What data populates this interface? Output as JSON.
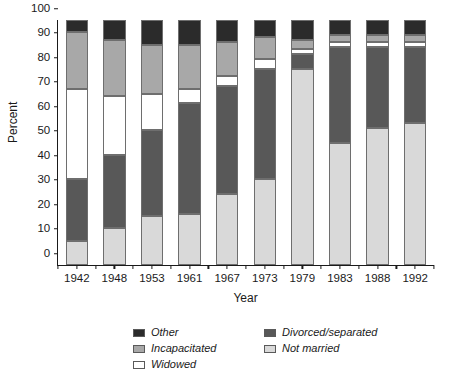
{
  "chart_data": {
    "type": "bar",
    "title": "",
    "subtitle": "",
    "xlabel": "Year",
    "ylabel": "Percent",
    "ylim": [
      0,
      100
    ],
    "yticks": [
      0,
      10,
      20,
      30,
      40,
      50,
      60,
      70,
      80,
      90,
      100
    ],
    "grid": false,
    "stacked": true,
    "stack_total": 100,
    "legend_position": "below-center",
    "categories": [
      "1942",
      "1948",
      "1953",
      "1961",
      "1967",
      "1973",
      "1979",
      "1983",
      "1988",
      "1992"
    ],
    "series": [
      {
        "name": "Not married",
        "color": "#d9d9d9",
        "values": [
          10,
          15,
          20,
          21,
          29,
          35,
          80,
          50,
          56,
          58
        ]
      },
      {
        "name": "Divorced/separated",
        "color": "#585858",
        "values": [
          25,
          30,
          35,
          45,
          44,
          45,
          6,
          39,
          33,
          31
        ]
      },
      {
        "name": "Widowed",
        "color": "#ffffff",
        "values": [
          37,
          24,
          15,
          6,
          4,
          4,
          2,
          2,
          2,
          2
        ]
      },
      {
        "name": "Incapacitated",
        "color": "#a8a8a8",
        "values": [
          23,
          23,
          20,
          18,
          14,
          9,
          4,
          3,
          3,
          3
        ]
      },
      {
        "name": "Other",
        "color": "#2b2b2b",
        "values": [
          5,
          8,
          10,
          10,
          9,
          7,
          8,
          6,
          6,
          6
        ]
      }
    ],
    "stack_boundaries": {
      "1942": [
        0,
        10,
        35,
        72,
        95,
        100
      ],
      "1948": [
        0,
        15,
        45,
        69,
        92,
        100
      ],
      "1953": [
        0,
        20,
        55,
        70,
        90,
        100
      ],
      "1961": [
        0,
        21,
        66,
        72,
        90,
        100
      ],
      "1967": [
        0,
        29,
        73,
        77,
        91,
        100
      ],
      "1973": [
        0,
        35,
        80,
        84,
        93,
        100
      ],
      "1979": [
        0,
        80,
        86,
        88,
        92,
        100
      ],
      "1983": [
        0,
        50,
        89,
        91,
        94,
        100
      ],
      "1988": [
        0,
        56,
        89,
        91,
        94,
        100
      ],
      "1992": [
        0,
        58,
        89,
        91,
        94,
        100
      ]
    }
  },
  "axes": {
    "y_title": "Percent",
    "x_title": "Year",
    "y_tick_labels": [
      "0",
      "10",
      "20",
      "30",
      "40",
      "50",
      "60",
      "70",
      "80",
      "90",
      "100"
    ],
    "x_tick_labels": [
      "1942",
      "1948",
      "1953",
      "1961",
      "1967",
      "1973",
      "1979",
      "1983",
      "1988",
      "1992"
    ]
  },
  "legend": {
    "entries": [
      {
        "label": "Other",
        "color": "#2b2b2b"
      },
      {
        "label": "Divorced/separated",
        "color": "#585858"
      },
      {
        "label": "Incapacitated",
        "color": "#a8a8a8"
      },
      {
        "label": "Not married",
        "color": "#d9d9d9"
      },
      {
        "label": "Widowed",
        "color": "#ffffff"
      }
    ]
  }
}
